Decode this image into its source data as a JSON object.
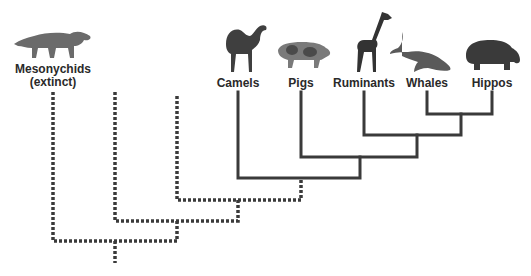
{
  "diagram": {
    "type": "phylogenetic-tree",
    "colors": {
      "solid_line": "#3a3a3a",
      "dotted_line": "#3a3a3a",
      "text": "#2a2a2a",
      "animal": "#4a4a4a"
    },
    "taxa": [
      {
        "id": "mesonychids",
        "label": "Mesonychids",
        "sublabel": "(extinct)",
        "x": 53,
        "line": "dotted"
      },
      {
        "id": "camels",
        "label": "Camels",
        "x": 238,
        "line": "solid"
      },
      {
        "id": "pigs",
        "label": "Pigs",
        "x": 301,
        "line": "solid"
      },
      {
        "id": "ruminants",
        "label": "Ruminants",
        "x": 364,
        "line": "solid"
      },
      {
        "id": "whales",
        "label": "Whales",
        "x": 427,
        "line": "solid"
      },
      {
        "id": "hippos",
        "label": "Hippos",
        "x": 492,
        "line": "solid"
      }
    ],
    "unlabeled_extinct_lineages": 2
  }
}
